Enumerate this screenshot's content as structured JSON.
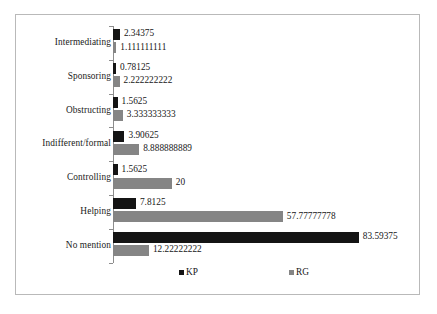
{
  "chart_data": {
    "type": "bar",
    "orientation": "horizontal",
    "title": "",
    "xlabel": "",
    "ylabel": "",
    "grid": false,
    "xlim": [
      0,
      100
    ],
    "legend_position": "bottom",
    "categories": [
      "Intermediating",
      "Sponsoring",
      "Obstructing",
      "Indifferent/formal",
      "Controlling",
      "Helping",
      "No mention"
    ],
    "series": [
      {
        "name": "KP",
        "color": "#141414",
        "values": [
          2.34375,
          0.78125,
          1.5625,
          3.90625,
          1.5625,
          7.8125,
          83.59375
        ],
        "labels": [
          "2.34375",
          "0.78125",
          "1.5625",
          "3.90625",
          "1.5625",
          "7.8125",
          "83.59375"
        ]
      },
      {
        "name": "RG",
        "color": "#858585",
        "values": [
          1.111111111,
          2.222222222,
          3.333333333,
          8.888888889,
          20,
          57.77777778,
          12.22222222
        ],
        "labels": [
          "1.111111111",
          "2.222222222",
          "3.333333333",
          "8.888888889",
          "20",
          "57.77777778",
          "12.22222222"
        ]
      }
    ]
  },
  "legend": {
    "items": [
      {
        "label": "KP",
        "color": "#141414"
      },
      {
        "label": "RG",
        "color": "#858585"
      }
    ]
  }
}
